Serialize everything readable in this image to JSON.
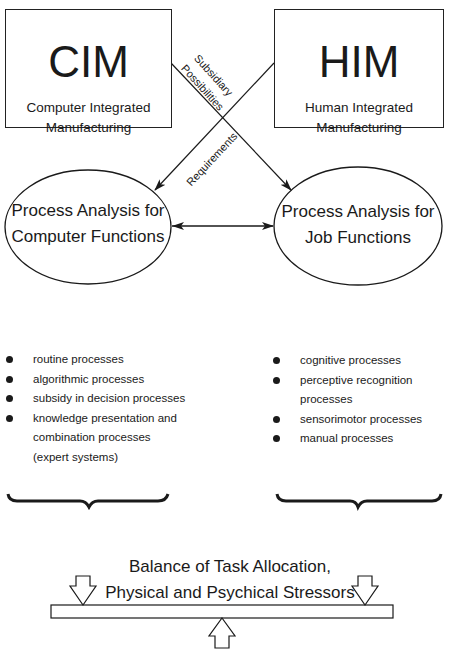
{
  "cim_box": {
    "title": "CIM",
    "subtitle_line1": "Computer Integrated",
    "subtitle_line2": "Manufacturing"
  },
  "him_box": {
    "title": "HIM",
    "subtitle_line1": "Human Integrated",
    "subtitle_line2": "Manufacturing"
  },
  "connector_labels": {
    "subsidiary_line1": "Subsidiary",
    "subsidiary_line2": "Possibilities",
    "requirements": "Requirements"
  },
  "left_ellipse": {
    "line1": "Process Analysis for",
    "line2": "Computer Functions"
  },
  "right_ellipse": {
    "line1": "Process Analysis for",
    "line2": "Job Functions"
  },
  "computer_processes": [
    {
      "text": "routine processes"
    },
    {
      "text": "algorithmic processes"
    },
    {
      "text": "subsidy in decision processes"
    },
    {
      "text": "knowledge presentation and",
      "cont1": "combination processes",
      "cont2": "(expert systems)"
    }
  ],
  "job_processes": [
    {
      "text": "cognitive processes"
    },
    {
      "text": "perceptive recognition processes"
    },
    {
      "text": "sensorimotor processes"
    },
    {
      "text": "manual processes"
    }
  ],
  "balance": {
    "title_line1": "Balance of Task Allocation,",
    "title_line2": "Physical and Psychical Stressors"
  },
  "colors": {
    "ink": "#1a1a1a",
    "background": "#ffffff"
  }
}
